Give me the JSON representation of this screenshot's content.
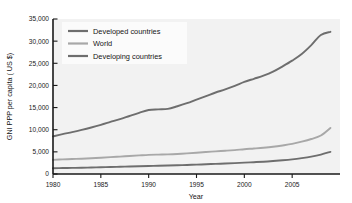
{
  "chart_data": {
    "type": "line",
    "title": "",
    "xlabel": "Year",
    "ylabel": "GNI PPP per capita ( US $)",
    "xlim": [
      1980,
      2010
    ],
    "ylim": [
      0,
      35000
    ],
    "grid": false,
    "legend_position": "top-left-inside",
    "xticks": [
      1980,
      1985,
      1990,
      1995,
      2000,
      2005
    ],
    "xtick_labels": [
      "1980",
      "1985",
      "1990",
      "1995",
      "2000",
      "2005"
    ],
    "yticks": [
      0,
      5000,
      10000,
      15000,
      20000,
      25000,
      30000,
      35000
    ],
    "ytick_labels": [
      "0",
      "5,000",
      "10,000",
      "15,000",
      "20,000",
      "25,000",
      "30,000",
      "35,000"
    ],
    "x": [
      1980,
      1981,
      1982,
      1983,
      1984,
      1985,
      1986,
      1987,
      1988,
      1989,
      1990,
      1991,
      1992,
      1993,
      1994,
      1995,
      1996,
      1997,
      1998,
      1999,
      2000,
      2001,
      2002,
      2003,
      2004,
      2005,
      2006,
      2007,
      2008,
      2009
    ],
    "series": [
      {
        "name": "Developed countries",
        "color": "#6e6e6e",
        "values": [
          8500,
          9000,
          9450,
          9950,
          10500,
          11100,
          11750,
          12400,
          13100,
          13800,
          14450,
          14600,
          14700,
          15300,
          16000,
          16800,
          17600,
          18400,
          19100,
          19900,
          20800,
          21500,
          22200,
          23100,
          24300,
          25600,
          27100,
          29100,
          31400,
          32100
        ]
      },
      {
        "name": "World",
        "color": "#a8a8a8",
        "values": [
          3200,
          3300,
          3380,
          3460,
          3560,
          3680,
          3800,
          3930,
          4070,
          4200,
          4320,
          4380,
          4430,
          4520,
          4650,
          4800,
          4960,
          5120,
          5250,
          5400,
          5600,
          5760,
          5930,
          6150,
          6450,
          6800,
          7300,
          7900,
          8700,
          10400
        ]
      },
      {
        "name": "Developing countries",
        "color": "#6e6e6e",
        "values": [
          1300,
          1340,
          1380,
          1420,
          1470,
          1520,
          1570,
          1630,
          1690,
          1750,
          1810,
          1860,
          1910,
          1970,
          2040,
          2120,
          2200,
          2290,
          2370,
          2460,
          2570,
          2670,
          2780,
          2920,
          3090,
          3300,
          3580,
          3920,
          4380,
          5000
        ]
      }
    ]
  },
  "legend": {
    "items": [
      {
        "label": "Developed countries"
      },
      {
        "label": "World"
      },
      {
        "label": "Developing countries"
      }
    ]
  },
  "colors": {
    "plot_background": "#f2f2f2",
    "axis": "#1a1a1a",
    "legend_background": "#fbfbfb",
    "developed": "#6e6e6e",
    "world": "#a8a8a8",
    "developing": "#6e6e6e"
  }
}
